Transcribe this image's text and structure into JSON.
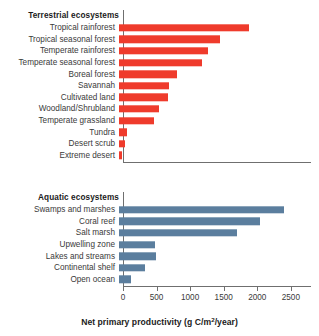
{
  "chart_data": {
    "type": "bar",
    "title": "",
    "orientation": "horizontal",
    "xlabel": "Net primary productivity (g C/m2/year)",
    "xlabel_parts": {
      "before": "Net primary productivity (g C/m",
      "sup": "2",
      "after": "/year)"
    },
    "ylabel": "",
    "xlim": [
      0,
      2800
    ],
    "xticks": [
      0,
      500,
      1000,
      1500,
      2000,
      2500
    ],
    "xtick_labels": [
      "0",
      "500",
      "1000",
      "1500",
      "2000",
      "2500"
    ],
    "grid": false,
    "legend": "none",
    "panels": [
      {
        "id": "terrestrial",
        "heading": "Terrestrial ecosystems",
        "color": "#ef3b2c",
        "categories": [
          "Tropical rainforest",
          "Tropical seasonal forest",
          "Temperate rainforest",
          "Temperate seasonal forest",
          "Boreal forest",
          "Savannah",
          "Cultivated land",
          "Woodland/Shrubland",
          "Temperate grassland",
          "Tundra",
          "Desert scrub",
          "Extreme desert"
        ],
        "values": [
          1930,
          1500,
          1330,
          1230,
          860,
          750,
          725,
          600,
          520,
          125,
          90,
          40
        ]
      },
      {
        "id": "aquatic",
        "heading": "Aquatic ecosystems",
        "color": "#5b7e9e",
        "categories": [
          "Swamps and marshes",
          "Coral reef",
          "Salt marsh",
          "Upwelling zone",
          "Lakes and streams",
          "Continental shelf",
          "Open ocean"
        ],
        "values": [
          2450,
          2100,
          1750,
          540,
          550,
          390,
          180
        ]
      }
    ]
  }
}
